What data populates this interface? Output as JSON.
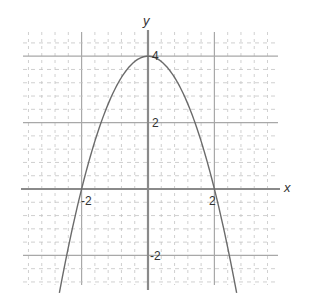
{
  "chart_data": {
    "type": "line",
    "title": "",
    "function": "y = 4 - x^2",
    "xlabel": "x",
    "ylabel": "y",
    "xlim": [
      -3.8,
      3.9
    ],
    "ylim": [
      -2.9,
      4.7
    ],
    "grid": true,
    "grid_major_step": 2,
    "grid_minor_step": 0.4,
    "x_ticks": [
      {
        "value": -2,
        "label": "-2"
      },
      {
        "value": 2,
        "label": "2"
      }
    ],
    "y_ticks": [
      {
        "value": 4,
        "label": "4"
      },
      {
        "value": 2,
        "label": "2"
      },
      {
        "value": -2,
        "label": "-2"
      }
    ],
    "series": [
      {
        "name": "parabola",
        "x": [
          -2.67,
          -2,
          -1.5,
          -1,
          -0.5,
          0,
          0.5,
          1,
          1.5,
          2,
          2.67
        ],
        "y": [
          -3.13,
          0,
          1.75,
          3,
          3.75,
          4,
          3.75,
          3,
          1.75,
          0,
          -3.13
        ]
      }
    ],
    "colors": {
      "curve": "#6b6b6b",
      "axis": "#8a8a8a",
      "major_grid": "#a8a8a8",
      "minor_grid": "#c4c4c4"
    }
  },
  "labels": {
    "x_axis": "x",
    "y_axis": "y",
    "tick_x_neg2": "-2",
    "tick_x_2": "2",
    "tick_y_4": "4",
    "tick_y_2": "2",
    "tick_y_neg2": "-2"
  }
}
